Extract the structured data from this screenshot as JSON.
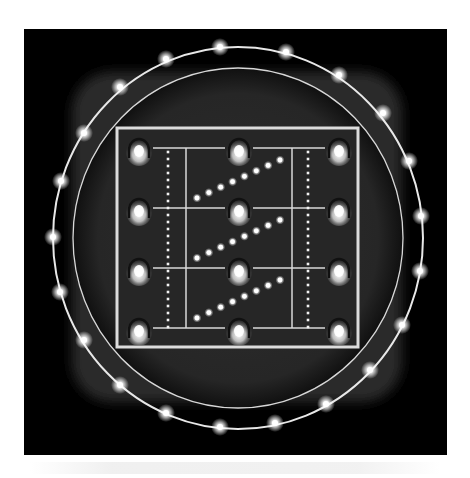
{
  "figure": {
    "colors": {
      "panel_background": "#000000",
      "disc_fill": "#2a2a2a",
      "line": "#e8e8e8",
      "glow": "#ffffff",
      "page_background": "#ffffff"
    },
    "panel": {
      "x": 24,
      "y": 29,
      "width": 423,
      "height": 426
    },
    "outer_ring": {
      "cx": 238,
      "cy": 238,
      "rx": 185,
      "ry": 191
    },
    "inner_ring": {
      "cx": 238,
      "cy": 238,
      "rx": 165,
      "ry": 170
    },
    "ring_glow_points": [
      [
        220,
        47
      ],
      [
        286,
        52
      ],
      [
        166,
        59
      ],
      [
        339,
        75
      ],
      [
        120,
        87
      ],
      [
        383,
        113
      ],
      [
        84,
        133
      ],
      [
        409,
        161
      ],
      [
        61,
        181
      ],
      [
        421,
        216
      ],
      [
        53,
        237
      ],
      [
        420,
        271
      ],
      [
        60,
        292
      ],
      [
        402,
        325
      ],
      [
        84,
        340
      ],
      [
        370,
        370
      ],
      [
        120,
        385
      ],
      [
        326,
        404
      ],
      [
        166,
        413
      ],
      [
        275,
        423
      ],
      [
        220,
        427
      ]
    ],
    "grid": {
      "square": {
        "x": 117,
        "y": 128,
        "width": 241,
        "height": 219
      },
      "electrode_columns": [
        139,
        239,
        339
      ],
      "electrode_rows": [
        150,
        210,
        270,
        330
      ],
      "solid_verticals": [
        186,
        292
      ],
      "dotted_verticals": [
        168,
        308
      ],
      "dotted_range": [
        152,
        329
      ],
      "dotted_spacing": 7,
      "diagonal_chains": [
        {
          "start": [
            197,
            198
          ],
          "end": [
            280,
            160
          ],
          "count": 8
        },
        {
          "start": [
            197,
            258
          ],
          "end": [
            280,
            220
          ],
          "count": 8
        },
        {
          "start": [
            197,
            318
          ],
          "end": [
            280,
            280
          ],
          "count": 8
        }
      ]
    }
  }
}
